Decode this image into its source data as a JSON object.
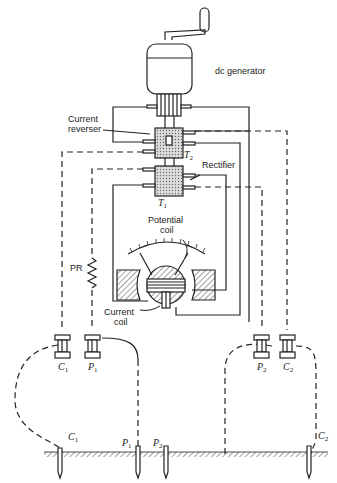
{
  "diagram": {
    "type": "earth-resistance megger circuit",
    "labels": {
      "generator": "dc generator",
      "current_reverser": "Current\nreverser",
      "current_reverser_l1": "Current",
      "current_reverser_l2": "reverser",
      "rectifier": "Rectifier",
      "t2": "T",
      "t2_sub": "2",
      "t1": "T",
      "t1_sub": "1",
      "potential_coil_l1": "Potential",
      "potential_coil_l2": "coil",
      "pr": "PR",
      "current_coil_l1": "Current",
      "current_coil_l2": "coil"
    },
    "terminals": [
      {
        "id": "C1",
        "letter": "C",
        "sub": "1"
      },
      {
        "id": "P1",
        "letter": "P",
        "sub": "1"
      },
      {
        "id": "P2",
        "letter": "P",
        "sub": "2"
      },
      {
        "id": "C2",
        "letter": "C",
        "sub": "2"
      }
    ],
    "electrodes": [
      {
        "id": "C1",
        "letter": "C",
        "sub": "1"
      },
      {
        "id": "P1",
        "letter": "P",
        "sub": "1"
      },
      {
        "id": "P2",
        "letter": "P",
        "sub": "2"
      },
      {
        "id": "C2",
        "letter": "C",
        "sub": "2"
      }
    ],
    "colors": {
      "line": "#222222",
      "hatch": "#555555",
      "fill": "#cccccc",
      "background": "#ffffff"
    }
  }
}
